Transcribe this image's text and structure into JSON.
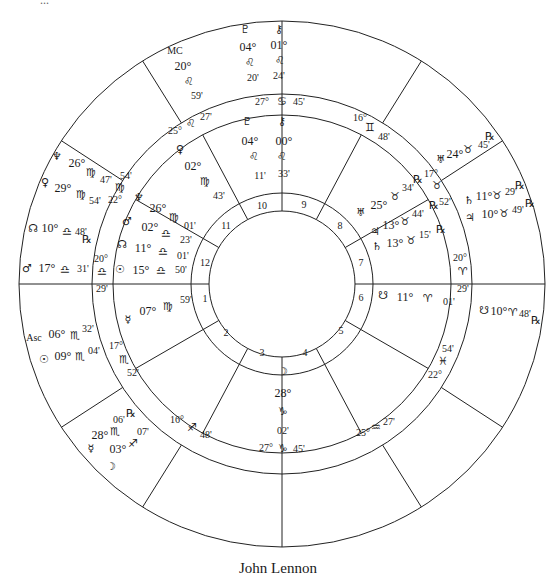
{
  "caption": "John Lennon",
  "top_clipped_text": "...",
  "geometry": {
    "cx": 282,
    "cy": 284,
    "r_outer": 263,
    "r_ring_outer": 190,
    "r_ring_inner": 169,
    "r_house_outer": 91,
    "r_house_inner": 73,
    "line_color": "#222222"
  },
  "inner_cusp_angles_deg": [
    0,
    30,
    62,
    90,
    118,
    150,
    180,
    210,
    242,
    270,
    298,
    330
  ],
  "outer_cusp_angles_deg": [
    0,
    33,
    58,
    90,
    122,
    147,
    180,
    213,
    238,
    270,
    302,
    327
  ],
  "house_numbers": [
    {
      "n": "1",
      "x": 205,
      "y": 298
    },
    {
      "n": "2",
      "x": 226,
      "y": 332
    },
    {
      "n": "3",
      "x": 262,
      "y": 352
    },
    {
      "n": "4",
      "x": 305,
      "y": 352
    },
    {
      "n": "5",
      "x": 341,
      "y": 330
    },
    {
      "n": "6",
      "x": 361,
      "y": 297
    },
    {
      "n": "7",
      "x": 361,
      "y": 262
    },
    {
      "n": "8",
      "x": 340,
      "y": 225
    },
    {
      "n": "9",
      "x": 304,
      "y": 204
    },
    {
      "n": "10",
      "x": 262,
      "y": 205
    },
    {
      "n": "11",
      "x": 226,
      "y": 225
    },
    {
      "n": "12",
      "x": 205,
      "y": 262
    }
  ],
  "cusp_labels": [
    {
      "text": "27°",
      "x": 262,
      "y": 102,
      "cls": "small"
    },
    {
      "text": "♋",
      "x": 282,
      "y": 102,
      "cls": "glyph"
    },
    {
      "text": "45'",
      "x": 299,
      "y": 102,
      "cls": "small"
    },
    {
      "text": "16°",
      "x": 360,
      "y": 118,
      "cls": "small"
    },
    {
      "text": "♊",
      "x": 370,
      "y": 128,
      "cls": "glyph"
    },
    {
      "text": "48'",
      "x": 384,
      "y": 137,
      "cls": "small"
    },
    {
      "text": "17°",
      "x": 431,
      "y": 174,
      "cls": "small"
    },
    {
      "text": "♉",
      "x": 437,
      "y": 186,
      "cls": "glyph"
    },
    {
      "text": "52'",
      "x": 445,
      "y": 202,
      "cls": "small"
    },
    {
      "text": "20°",
      "x": 460,
      "y": 258,
      "cls": "small"
    },
    {
      "text": "♈",
      "x": 463,
      "y": 272,
      "cls": "glyph"
    },
    {
      "text": "29'",
      "x": 463,
      "y": 289,
      "cls": "small"
    },
    {
      "text": "54'",
      "x": 448,
      "y": 349,
      "cls": "small"
    },
    {
      "text": "♓",
      "x": 443,
      "y": 362,
      "cls": "glyph"
    },
    {
      "text": "22°",
      "x": 435,
      "y": 375,
      "cls": "small"
    },
    {
      "text": "25°",
      "x": 363,
      "y": 433,
      "cls": "small"
    },
    {
      "text": "♒",
      "x": 376,
      "y": 428,
      "cls": "glyph"
    },
    {
      "text": "27'",
      "x": 389,
      "y": 422,
      "cls": "small"
    },
    {
      "text": "27°",
      "x": 266,
      "y": 448,
      "cls": "small"
    },
    {
      "text": "♑",
      "x": 283,
      "y": 449,
      "cls": "glyph"
    },
    {
      "text": "45'",
      "x": 299,
      "y": 449,
      "cls": "small"
    },
    {
      "text": "16°",
      "x": 177,
      "y": 420,
      "cls": "small"
    },
    {
      "text": "♐",
      "x": 192,
      "y": 428,
      "cls": "glyph"
    },
    {
      "text": "48'",
      "x": 206,
      "y": 435,
      "cls": "small"
    },
    {
      "text": "17°",
      "x": 116,
      "y": 346,
      "cls": "small"
    },
    {
      "text": "♏",
      "x": 124,
      "y": 360,
      "cls": "glyph"
    },
    {
      "text": "52'",
      "x": 133,
      "y": 373,
      "cls": "small"
    },
    {
      "text": "20°",
      "x": 101,
      "y": 259,
      "cls": "small"
    },
    {
      "text": "♎",
      "x": 102,
      "y": 272,
      "cls": "glyph"
    },
    {
      "text": "29'",
      "x": 102,
      "y": 289,
      "cls": "small"
    },
    {
      "text": "54'",
      "x": 126,
      "y": 176,
      "cls": "small"
    },
    {
      "text": "♍",
      "x": 120,
      "y": 188,
      "cls": "glyph"
    },
    {
      "text": "22°",
      "x": 115,
      "y": 200,
      "cls": "small"
    },
    {
      "text": "25°",
      "x": 175,
      "y": 131,
      "cls": "small"
    },
    {
      "text": "♌",
      "x": 191,
      "y": 124,
      "cls": "glyph"
    },
    {
      "text": "27'",
      "x": 206,
      "y": 117,
      "cls": "small"
    }
  ],
  "natal_labels": [
    {
      "text": "♇",
      "x": 247,
      "y": 122,
      "cls": "glyph"
    },
    {
      "text": "⚷",
      "x": 282,
      "y": 122,
      "cls": "glyph"
    },
    {
      "text": "04°",
      "x": 250,
      "y": 141,
      "cls": ""
    },
    {
      "text": "00°",
      "x": 284,
      "y": 141,
      "cls": ""
    },
    {
      "text": "♌",
      "x": 254,
      "y": 157,
      "cls": "glyph"
    },
    {
      "text": "♌",
      "x": 282,
      "y": 157,
      "cls": "glyph"
    },
    {
      "text": "11'",
      "x": 260,
      "y": 176,
      "cls": "small"
    },
    {
      "text": "33'",
      "x": 284,
      "y": 174,
      "cls": "small"
    },
    {
      "text": "♀",
      "x": 180,
      "y": 150,
      "cls": "glyph"
    },
    {
      "text": "02°",
      "x": 193,
      "y": 166,
      "cls": ""
    },
    {
      "text": "♍",
      "x": 205,
      "y": 182,
      "cls": "glyph"
    },
    {
      "text": "43'",
      "x": 219,
      "y": 196,
      "cls": "small"
    },
    {
      "text": "♆",
      "x": 139,
      "y": 198,
      "cls": "glyph"
    },
    {
      "text": "26°",
      "x": 158,
      "y": 208,
      "cls": ""
    },
    {
      "text": "♍",
      "x": 174,
      "y": 218,
      "cls": "glyph"
    },
    {
      "text": "01'",
      "x": 190,
      "y": 226,
      "cls": "small"
    },
    {
      "text": "♂",
      "x": 127,
      "y": 222,
      "cls": "glyph"
    },
    {
      "text": "02°",
      "x": 150,
      "y": 227,
      "cls": ""
    },
    {
      "text": "♎",
      "x": 166,
      "y": 234,
      "cls": "glyph"
    },
    {
      "text": "23'",
      "x": 186,
      "y": 240,
      "cls": "small"
    },
    {
      "text": "☊",
      "x": 122,
      "y": 245,
      "cls": "glyph"
    },
    {
      "text": "11°",
      "x": 143,
      "y": 248,
      "cls": ""
    },
    {
      "text": "♎",
      "x": 163,
      "y": 252,
      "cls": "glyph"
    },
    {
      "text": "01'",
      "x": 183,
      "y": 256,
      "cls": "small"
    },
    {
      "text": "☉",
      "x": 120,
      "y": 270,
      "cls": "glyph"
    },
    {
      "text": "15°",
      "x": 141,
      "y": 270,
      "cls": ""
    },
    {
      "text": "♎",
      "x": 161,
      "y": 271,
      "cls": "glyph"
    },
    {
      "text": "50'",
      "x": 181,
      "y": 270,
      "cls": "small"
    },
    {
      "text": "☿",
      "x": 128,
      "y": 320,
      "cls": "glyph"
    },
    {
      "text": "07°",
      "x": 148,
      "y": 311,
      "cls": ""
    },
    {
      "text": "♍",
      "x": 168,
      "y": 307,
      "cls": "glyph"
    },
    {
      "text": "59'",
      "x": 186,
      "y": 300,
      "cls": "small"
    },
    {
      "text": "♅",
      "x": 361,
      "y": 213,
      "cls": "glyph"
    },
    {
      "text": "25°",
      "x": 379,
      "y": 205,
      "cls": ""
    },
    {
      "text": "♉",
      "x": 395,
      "y": 197,
      "cls": "glyph"
    },
    {
      "text": "34'",
      "x": 408,
      "y": 188,
      "cls": "small"
    },
    {
      "text": "℞",
      "x": 418,
      "y": 180,
      "cls": "glyph"
    },
    {
      "text": "♃",
      "x": 375,
      "y": 232,
      "cls": "glyph"
    },
    {
      "text": "13°",
      "x": 391,
      "y": 225,
      "cls": ""
    },
    {
      "text": "♉",
      "x": 405,
      "y": 222,
      "cls": "glyph"
    },
    {
      "text": "44'",
      "x": 418,
      "y": 214,
      "cls": "small"
    },
    {
      "text": "℞",
      "x": 434,
      "y": 206,
      "cls": "glyph"
    },
    {
      "text": "♄",
      "x": 377,
      "y": 247,
      "cls": "glyph"
    },
    {
      "text": "13°",
      "x": 395,
      "y": 243,
      "cls": ""
    },
    {
      "text": "♉",
      "x": 411,
      "y": 241,
      "cls": "glyph"
    },
    {
      "text": "15'",
      "x": 425,
      "y": 235,
      "cls": "small"
    },
    {
      "text": "℞",
      "x": 441,
      "y": 230,
      "cls": "glyph"
    },
    {
      "text": "☋",
      "x": 383,
      "y": 296,
      "cls": "glyph"
    },
    {
      "text": "11°",
      "x": 405,
      "y": 297,
      "cls": ""
    },
    {
      "text": "♈",
      "x": 428,
      "y": 299,
      "cls": "glyph"
    },
    {
      "text": "01'",
      "x": 449,
      "y": 302,
      "cls": "small"
    },
    {
      "text": "☽",
      "x": 283,
      "y": 372,
      "cls": "glyph"
    },
    {
      "text": "28°",
      "x": 283,
      "y": 393,
      "cls": ""
    },
    {
      "text": "♑",
      "x": 283,
      "y": 412,
      "cls": "glyph"
    },
    {
      "text": "02'",
      "x": 283,
      "y": 431,
      "cls": "small"
    }
  ],
  "transit_labels": [
    {
      "text": "♇",
      "x": 245,
      "y": 30,
      "cls": "glyph"
    },
    {
      "text": "⚷",
      "x": 279,
      "y": 30,
      "cls": "glyph"
    },
    {
      "text": "04°",
      "x": 248,
      "y": 47,
      "cls": ""
    },
    {
      "text": "01°",
      "x": 279,
      "y": 45,
      "cls": ""
    },
    {
      "text": "♌",
      "x": 250,
      "y": 63,
      "cls": "glyph"
    },
    {
      "text": "♌",
      "x": 280,
      "y": 61,
      "cls": "glyph"
    },
    {
      "text": "20'",
      "x": 253,
      "y": 78,
      "cls": "small"
    },
    {
      "text": "24'",
      "x": 279,
      "y": 76,
      "cls": "small"
    },
    {
      "text": "MC",
      "x": 175,
      "y": 51,
      "cls": "small"
    },
    {
      "text": "20°",
      "x": 183,
      "y": 66,
      "cls": ""
    },
    {
      "text": "♌",
      "x": 189,
      "y": 82,
      "cls": "glyph"
    },
    {
      "text": "59'",
      "x": 197,
      "y": 96,
      "cls": "small"
    },
    {
      "text": "♆",
      "x": 57,
      "y": 157,
      "cls": "glyph"
    },
    {
      "text": "26°",
      "x": 77,
      "y": 163,
      "cls": ""
    },
    {
      "text": "♍",
      "x": 91,
      "y": 173,
      "cls": "glyph"
    },
    {
      "text": "47'",
      "x": 106,
      "y": 180,
      "cls": "small"
    },
    {
      "text": "♀",
      "x": 45,
      "y": 183,
      "cls": "glyph"
    },
    {
      "text": "29°",
      "x": 63,
      "y": 188,
      "cls": ""
    },
    {
      "text": "♍",
      "x": 81,
      "y": 195,
      "cls": "glyph"
    },
    {
      "text": "54'",
      "x": 95,
      "y": 201,
      "cls": "small"
    },
    {
      "text": "☊",
      "x": 33,
      "y": 229,
      "cls": "glyph"
    },
    {
      "text": "10°",
      "x": 50,
      "y": 228,
      "cls": ""
    },
    {
      "text": "♎",
      "x": 67,
      "y": 232,
      "cls": "glyph"
    },
    {
      "text": "48'",
      "x": 81,
      "y": 232,
      "cls": "small"
    },
    {
      "text": "℞",
      "x": 87,
      "y": 240,
      "cls": "glyph"
    },
    {
      "text": "♂",
      "x": 27,
      "y": 269,
      "cls": "glyph"
    },
    {
      "text": "17°",
      "x": 47,
      "y": 268,
      "cls": ""
    },
    {
      "text": "♎",
      "x": 65,
      "y": 270,
      "cls": "glyph"
    },
    {
      "text": "31'",
      "x": 83,
      "y": 269,
      "cls": "small"
    },
    {
      "text": "Asc",
      "x": 34,
      "y": 338,
      "cls": "small"
    },
    {
      "text": "06°",
      "x": 57,
      "y": 334,
      "cls": ""
    },
    {
      "text": "♏",
      "x": 75,
      "y": 336,
      "cls": "glyph"
    },
    {
      "text": "32'",
      "x": 88,
      "y": 329,
      "cls": "small"
    },
    {
      "text": "☉",
      "x": 44,
      "y": 360,
      "cls": "glyph"
    },
    {
      "text": "09°",
      "x": 63,
      "y": 356,
      "cls": ""
    },
    {
      "text": "♏",
      "x": 80,
      "y": 357,
      "cls": "glyph"
    },
    {
      "text": "04'",
      "x": 94,
      "y": 351,
      "cls": "small"
    },
    {
      "text": "℞",
      "x": 131,
      "y": 414,
      "cls": "glyph"
    },
    {
      "text": "06'",
      "x": 119,
      "y": 420,
      "cls": "small"
    },
    {
      "text": "28°",
      "x": 100,
      "y": 435,
      "cls": ""
    },
    {
      "text": "♏",
      "x": 115,
      "y": 432,
      "cls": "glyph"
    },
    {
      "text": "07'",
      "x": 143,
      "y": 432,
      "cls": "small"
    },
    {
      "text": "☿",
      "x": 91,
      "y": 449,
      "cls": "glyph"
    },
    {
      "text": "03°",
      "x": 118,
      "y": 449,
      "cls": ""
    },
    {
      "text": "♐",
      "x": 133,
      "y": 444,
      "cls": "glyph"
    },
    {
      "text": "☽",
      "x": 111,
      "y": 467,
      "cls": "glyph"
    },
    {
      "text": "♅",
      "x": 441,
      "y": 160,
      "cls": "glyph"
    },
    {
      "text": "24°",
      "x": 455,
      "y": 154,
      "cls": ""
    },
    {
      "text": "♉",
      "x": 468,
      "y": 150,
      "cls": "glyph"
    },
    {
      "text": "45'",
      "x": 484,
      "y": 145,
      "cls": "small"
    },
    {
      "text": "℞",
      "x": 490,
      "y": 137,
      "cls": "glyph"
    },
    {
      "text": "♄",
      "x": 469,
      "y": 201,
      "cls": "glyph"
    },
    {
      "text": "11°",
      "x": 484,
      "y": 196,
      "cls": ""
    },
    {
      "text": "♉",
      "x": 497,
      "y": 196,
      "cls": "glyph"
    },
    {
      "text": "29'",
      "x": 511,
      "y": 192,
      "cls": "small"
    },
    {
      "text": "℞",
      "x": 520,
      "y": 186,
      "cls": "glyph"
    },
    {
      "text": "♃",
      "x": 470,
      "y": 218,
      "cls": "glyph"
    },
    {
      "text": "10°",
      "x": 490,
      "y": 214,
      "cls": ""
    },
    {
      "text": "♉",
      "x": 504,
      "y": 214,
      "cls": "glyph"
    },
    {
      "text": "49'",
      "x": 518,
      "y": 210,
      "cls": "small"
    },
    {
      "text": "℞",
      "x": 530,
      "y": 204,
      "cls": "glyph"
    },
    {
      "text": "☋",
      "x": 484,
      "y": 311,
      "cls": "glyph"
    },
    {
      "text": "10°",
      "x": 499,
      "y": 311,
      "cls": ""
    },
    {
      "text": "♈",
      "x": 513,
      "y": 313,
      "cls": "glyph"
    },
    {
      "text": "48'",
      "x": 525,
      "y": 314,
      "cls": "small"
    },
    {
      "text": "℞",
      "x": 536,
      "y": 321,
      "cls": "glyph"
    }
  ]
}
